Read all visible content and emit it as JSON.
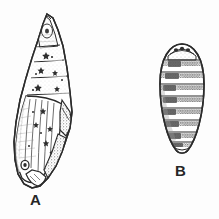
{
  "figure": {
    "background_color": "#fdfdfd",
    "ink_color": "#2b2b2b",
    "shade_color": "#777777",
    "width": 219,
    "height": 219,
    "style": "black-and-white scientific ink illustration"
  },
  "labels": {
    "a": "A",
    "b": "B"
  },
  "specimens": [
    {
      "id": "a",
      "label": "A",
      "icon_name": "pupa-lateral-icon",
      "description": "Elongate pointed pupa, lateral view, with cremaster tip, segmented abdomen and large wing case",
      "view": "lateral",
      "outline_color": "#2b2b2b",
      "segment_count": 5,
      "bounds": {
        "x": 12,
        "y": 13,
        "width": 63,
        "height": 177
      },
      "label_position": {
        "x": 30,
        "y": 192
      }
    },
    {
      "id": "b",
      "label": "B",
      "icon_name": "pupa-dorsal-icon",
      "description": "Oval puparium, dorsal view, with rounded anterior bearing paired spots and transverse banded segments",
      "view": "dorsal",
      "outline_color": "#2b2b2b",
      "segment_count": 9,
      "bounds": {
        "x": 160,
        "y": 44,
        "width": 44,
        "height": 112
      },
      "label_position": {
        "x": 175,
        "y": 163
      }
    }
  ]
}
